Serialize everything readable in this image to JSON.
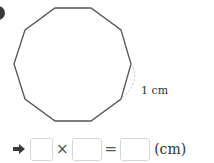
{
  "problem": {
    "bullet_icon": "circle-bullet-icon",
    "shape": "regular-decagon",
    "side_label": "1 cm",
    "colors": {
      "polygon_stroke": "#555555",
      "dashed_marker": "#b0b0b0",
      "box_border": "#d6d6d6",
      "text": "#333333"
    }
  },
  "equation": {
    "arrow_icon": "right-arrow-icon",
    "box1_value": "",
    "operator_multiply": "×",
    "box2_value": "",
    "operator_equals": "=",
    "box3_value": "",
    "unit": "(cm)"
  }
}
